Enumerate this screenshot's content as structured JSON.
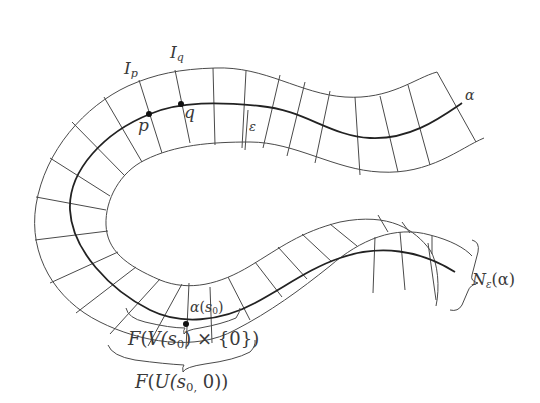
{
  "diagram": {
    "colors": {
      "line": "#4a4a4a",
      "curve": "#222222",
      "text": "#3a3a3a",
      "background": "#ffffff"
    },
    "labels": {
      "curve": "α",
      "point_p": "p",
      "point_q": "q",
      "fiber_p": "I",
      "fiber_p_sub": "p",
      "fiber_q": "I",
      "fiber_q_sub": "q",
      "epsilon": "ε",
      "neighborhood": "N",
      "neighborhood_sub": "ε",
      "neighborhood_arg": "(α)",
      "alpha_s0": "α",
      "alpha_s0_arg_open": "(",
      "alpha_s0_var": "s",
      "alpha_s0_sub": "0",
      "alpha_s0_arg_close": ")",
      "F_V": "F",
      "F_V_open": "(",
      "F_V_V": "V",
      "F_V_inner": "(s",
      "F_V_sub": "0",
      "F_V_rest": ") × {0})",
      "F_U": "F",
      "F_U_open": "(",
      "F_U_U": "U",
      "F_U_inner": "(s",
      "F_U_sub": "0,",
      "F_U_rest": " 0))"
    },
    "points": [
      "p",
      "q",
      "α(s0)"
    ]
  }
}
